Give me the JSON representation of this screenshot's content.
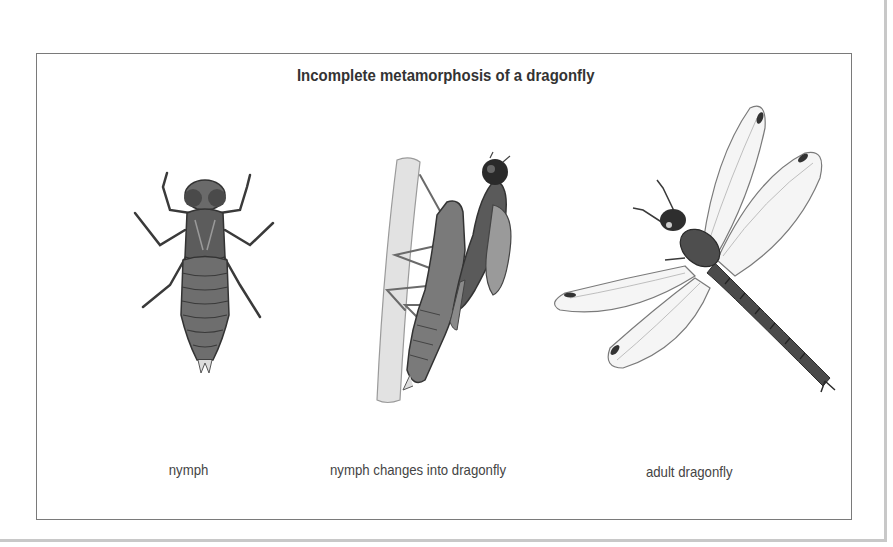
{
  "diagram": {
    "title": "Incomplete metamorphosis of a dragonfly",
    "stages": [
      {
        "label": "nymph",
        "illustration": "dragonfly-nymph-illustration"
      },
      {
        "label": "nymph changes into dragonfly",
        "illustration": "emerging-dragonfly-illustration"
      },
      {
        "label": "adult dragonfly",
        "illustration": "adult-dragonfly-illustration"
      }
    ],
    "colors": {
      "frame": "#7a7a7a",
      "text": "#333333",
      "ink": "#3a3a3a"
    }
  }
}
